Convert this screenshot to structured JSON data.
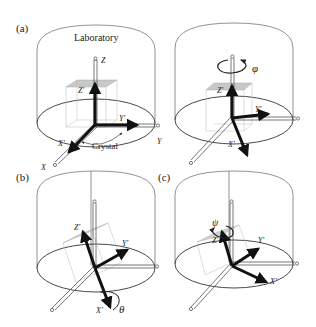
{
  "figure": {
    "panels": [
      {
        "id": "a",
        "tag": "(a)",
        "title": "Laboratory",
        "crystal_label": "Crystal",
        "lab_axes": {
          "x": "X",
          "y": "Y",
          "z": "Z"
        },
        "crystal_axes": {
          "x": "X'",
          "y": "Y'",
          "z": "Z'"
        }
      },
      {
        "id": "a2",
        "tag": "",
        "rotation_symbol": "φ",
        "crystal_axes": {
          "x": "X'",
          "y": "Y'",
          "z": "Z'"
        }
      },
      {
        "id": "b",
        "tag": "(b)",
        "rotation_symbol": "θ",
        "crystal_axes": {
          "x": "X'",
          "y": "Y'",
          "z": "Z'"
        }
      },
      {
        "id": "c",
        "tag": "(c)",
        "rotation_symbol": "ψ",
        "crystal_axes": {
          "x": "X'",
          "y": "Y'",
          "z": "Z'"
        }
      }
    ],
    "colors": {
      "lab_frame": "#555555",
      "crystal_axes": "#111111",
      "crystal_box_top": "#c8c8c8",
      "crystal_box_edges": "#aaaaaa",
      "background": "#ffffff"
    }
  }
}
